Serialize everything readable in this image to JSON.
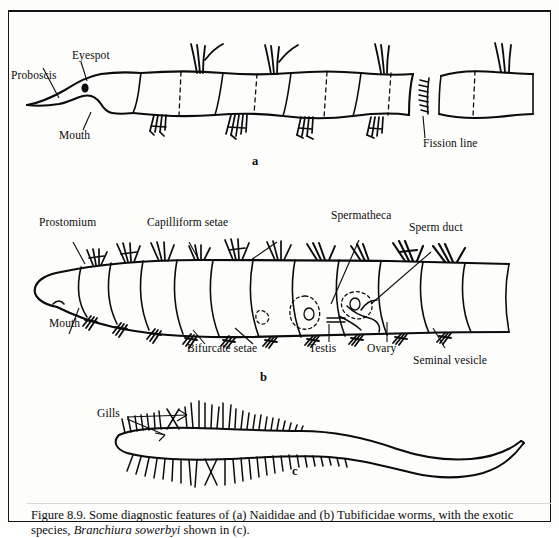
{
  "figure": {
    "caption_line1": "Figure 8.9.  Some diagnostic features of (a) Naididae and (b) Tubificidae worms, with the",
    "caption_line2_pre": "exotic species, ",
    "caption_species": "Branchiura sowerbyi",
    "caption_line2_post": " shown in (c)."
  },
  "panels": {
    "a_label": "a",
    "b_label": "b",
    "c_label": "c"
  },
  "diagram_a": {
    "name": "Naididae worm",
    "labels": {
      "proboscis": "Proboscis",
      "eyespot": "Eyespot",
      "mouth": "Mouth",
      "fission_line": "Fission line"
    }
  },
  "diagram_b": {
    "name": "Tubificidae worm",
    "labels": {
      "prostomium": "Prostomium",
      "capilliform_setae": "Capilliform setae",
      "spermatheca": "Spermatheca",
      "sperm_duct": "Sperm duct",
      "mouth": "Mouth",
      "bifurcate_setae": "Bifurcate setae",
      "testis": "Testis",
      "ovary": "Ovary",
      "seminal_vesicle": "Seminal vesicle"
    }
  },
  "diagram_c": {
    "name": "Branchiura sowerbyi",
    "labels": {
      "gills": "Gills"
    }
  },
  "colors": {
    "ink": "#0b0b0b",
    "paper": "#fdfdfb",
    "border": "#141414"
  }
}
